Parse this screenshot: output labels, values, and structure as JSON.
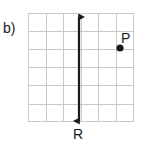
{
  "figure": {
    "part_label": "b)",
    "width": 141,
    "height": 145,
    "background_color": "#ffffff"
  },
  "grid": {
    "x": 28,
    "y": 13,
    "width": 105,
    "height": 109,
    "columns": 6,
    "rows": 6,
    "line_color": "#c9c9c9",
    "line_width": 1
  },
  "line": {
    "name_label": "R",
    "orientation": "vertical",
    "x": 79,
    "y_top": 10,
    "y_bottom": 128,
    "stroke_color": "#1a1a1a",
    "stroke_width": 2,
    "arrowheads": "both"
  },
  "point": {
    "name_label": "P",
    "x": 120,
    "y": 48,
    "radius": 3.5,
    "fill_color": "#1a1a1a"
  },
  "labels": {
    "part": "b)",
    "point_p": "P",
    "line_r": "R"
  }
}
